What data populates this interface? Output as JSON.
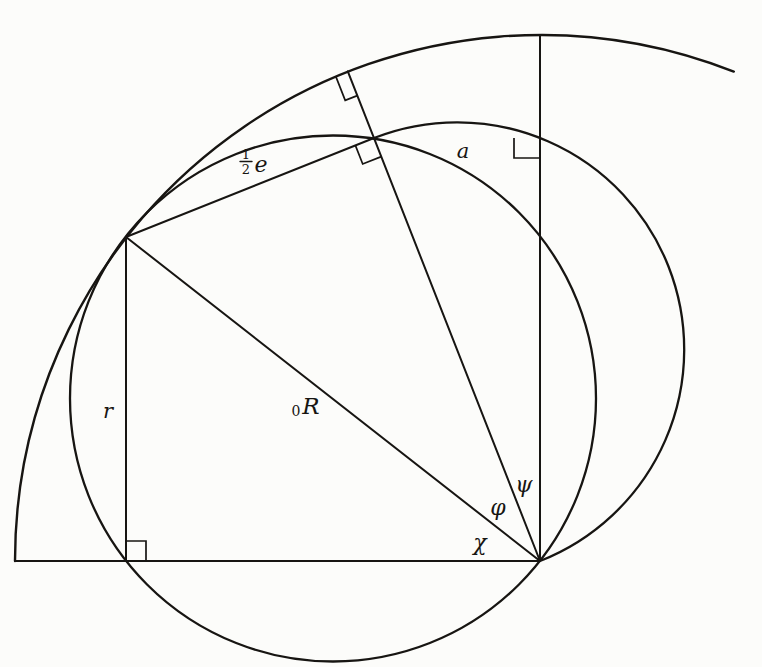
{
  "figure": {
    "width": 762,
    "height": 667,
    "background": "#fcfcfa",
    "ink": "#171512",
    "geometry": {
      "circles": [
        {
          "name": "left-circle-diameter-OP1",
          "cx": 333,
          "cy": 398.5,
          "r": 263,
          "sw": 2.3
        }
      ],
      "arcs": [
        {
          "name": "outer-large-arc",
          "d": "M 15 561 A 526 526 0 0 1 733.8 71.6",
          "sw": 2.4
        },
        {
          "name": "right-semicircle-diameter-OP2",
          "d": "M 374 138 A 227.2 227.2 0 0 1 540 561",
          "sw": 2.3
        }
      ],
      "lines": [
        {
          "name": "baseline",
          "x1": 15,
          "y1": 561,
          "x2": 540,
          "y2": 561,
          "sw": 2.0
        },
        {
          "name": "apsidal-vertical-line",
          "x1": 540,
          "y1": 561,
          "x2": 540,
          "y2": 35,
          "sw": 2.0
        },
        {
          "name": "r-perpendicular-line",
          "x1": 126,
          "y1": 237,
          "x2": 126,
          "y2": 561,
          "sw": 2.0
        },
        {
          "name": "R0-chord-line",
          "x1": 126,
          "y1": 237,
          "x2": 540,
          "y2": 561,
          "sw": 2.0
        },
        {
          "name": "half-e-chord-line",
          "x1": 126,
          "y1": 237,
          "x2": 374,
          "y2": 138,
          "sw": 2.0
        },
        {
          "name": "psi-ray-through-P2",
          "x1": 540,
          "y1": 561,
          "x2": 347.8,
          "y2": 71.4,
          "sw": 2.0
        },
        {
          "name": "fraction-bar",
          "x1": 240,
          "y1": 161.5,
          "x2": 252,
          "y2": 161.5,
          "sw": 1.4
        }
      ],
      "marks": [
        {
          "name": "right-angle-mark-baseline-foot",
          "points": "126,541 146,541 146,561",
          "sw": 1.7
        },
        {
          "name": "right-angle-mark-a-corner",
          "points": "514,138 514,158 540,158",
          "sw": 1.7
        },
        {
          "name": "right-angle-mark-at-P2",
          "points": "355.4,145.4 362.7,164 381.3,156.6",
          "sw": 1.7
        },
        {
          "name": "right-angle-mark-at-outer-arc",
          "points": "357.3,95.6 345.2,100.3 335.7,76.1",
          "sw": 1.7
        }
      ]
    },
    "labels": [
      {
        "name": "label-half-e-numerator",
        "text": "1",
        "x": 246,
        "y": 159,
        "size": 13,
        "italic": false
      },
      {
        "name": "label-half-e-denominator",
        "text": "2",
        "x": 246,
        "y": 174,
        "size": 13,
        "italic": false
      },
      {
        "name": "label-half-e-letter",
        "text": "e",
        "x": 261,
        "y": 172,
        "size": 22,
        "italic": true
      },
      {
        "name": "label-a",
        "text": "a",
        "x": 463,
        "y": 158,
        "size": 21,
        "italic": true
      },
      {
        "name": "label-r",
        "text": "r",
        "x": 108,
        "y": 418,
        "size": 21,
        "italic": true
      },
      {
        "name": "label-R-subscript-zero",
        "text": "0",
        "x": 296,
        "y": 416,
        "size": 14,
        "italic": false
      },
      {
        "name": "label-R",
        "text": "R",
        "x": 311,
        "y": 414,
        "size": 23,
        "italic": true
      },
      {
        "name": "label-psi",
        "text": "ψ",
        "x": 524,
        "y": 492,
        "size": 22,
        "italic": true
      },
      {
        "name": "label-phi",
        "text": "φ",
        "x": 498,
        "y": 515,
        "size": 22,
        "italic": true
      },
      {
        "name": "label-chi",
        "text": "χ",
        "x": 480,
        "y": 550,
        "size": 22,
        "italic": true
      }
    ]
  }
}
